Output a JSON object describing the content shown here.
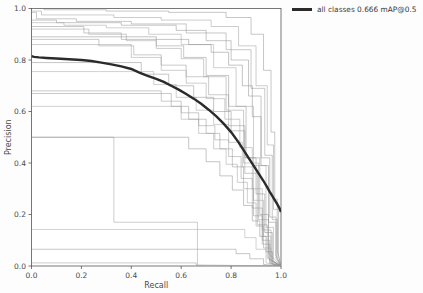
{
  "legend": {
    "entries": [
      {
        "label": "all classes 0.666 mAP@0.5",
        "color": "#2b2b2b",
        "style": "solid-thick"
      }
    ],
    "position": "top-right-outside"
  },
  "axes": {
    "xlabel": "Recall",
    "ylabel": "Precision",
    "xticks": [
      "0.0",
      "0.2",
      "0.4",
      "0.6",
      "0.8",
      "1.0"
    ],
    "yticks": [
      "0.0",
      "0.2",
      "0.4",
      "0.6",
      "0.8",
      "1.0"
    ],
    "xlim": [
      0,
      1
    ],
    "ylim": [
      0,
      1
    ]
  },
  "chart_data": {
    "type": "line",
    "title": "",
    "xlabel": "Recall",
    "ylabel": "Precision",
    "xlim": [
      0,
      1
    ],
    "ylim": [
      0,
      1
    ],
    "grid": false,
    "legend_position": "upper right outside",
    "tick_labels": {
      "x": [
        "0.0",
        "0.2",
        "0.4",
        "0.6",
        "0.8",
        "1.0"
      ],
      "y": [
        "0.0",
        "0.2",
        "0.4",
        "0.6",
        "0.8",
        "1.0"
      ]
    },
    "annotations": [
      "all classes 0.666 mAP@0.5"
    ],
    "series": [
      {
        "name": "all classes 0.666 mAP@0.5",
        "kind": "mean",
        "color": "#2b2b2b",
        "linewidth": 2.4,
        "x": [
          0.0,
          0.01,
          0.03,
          0.06,
          0.1,
          0.15,
          0.2,
          0.24,
          0.28,
          0.32,
          0.36,
          0.4,
          0.43,
          0.46,
          0.5,
          0.53,
          0.56,
          0.59,
          0.62,
          0.65,
          0.68,
          0.71,
          0.74,
          0.77,
          0.8,
          0.83,
          0.85,
          0.87,
          0.89,
          0.91,
          0.93,
          0.945,
          0.955,
          0.965,
          0.975,
          0.985,
          0.995,
          1.0
        ],
        "y": [
          0.815,
          0.812,
          0.81,
          0.808,
          0.806,
          0.803,
          0.8,
          0.796,
          0.79,
          0.783,
          0.775,
          0.765,
          0.752,
          0.74,
          0.727,
          0.715,
          0.7,
          0.685,
          0.668,
          0.65,
          0.63,
          0.607,
          0.582,
          0.553,
          0.52,
          0.48,
          0.45,
          0.42,
          0.39,
          0.36,
          0.33,
          0.305,
          0.288,
          0.272,
          0.256,
          0.24,
          0.222,
          0.21
        ]
      },
      {
        "name": "class-a",
        "kind": "per-class",
        "color": "#8d8d8d",
        "x": [
          0.0,
          0.05,
          0.05,
          0.3,
          0.3,
          0.55,
          0.55,
          0.78,
          0.78,
          0.88,
          0.88,
          0.93,
          0.93,
          0.96,
          0.96,
          0.975,
          0.975,
          0.985,
          0.985,
          1.0
        ],
        "y": [
          1.0,
          1.0,
          0.995,
          0.995,
          0.99,
          0.99,
          0.985,
          0.985,
          0.965,
          0.965,
          0.9,
          0.9,
          0.76,
          0.76,
          0.52,
          0.52,
          0.26,
          0.26,
          0.06,
          0.0
        ]
      },
      {
        "name": "class-b",
        "kind": "per-class",
        "color": "#999999",
        "x": [
          0.0,
          0.04,
          0.04,
          0.33,
          0.33,
          0.52,
          0.52,
          0.72,
          0.72,
          0.83,
          0.83,
          0.9,
          0.9,
          0.945,
          0.945,
          0.97,
          0.97,
          0.99,
          0.99,
          1.0
        ],
        "y": [
          0.99,
          0.99,
          0.975,
          0.975,
          0.965,
          0.965,
          0.955,
          0.955,
          0.93,
          0.93,
          0.855,
          0.855,
          0.7,
          0.7,
          0.47,
          0.47,
          0.22,
          0.22,
          0.04,
          0.0
        ]
      },
      {
        "name": "class-c",
        "kind": "per-class",
        "color": "#909090",
        "x": [
          0.0,
          0.02,
          0.02,
          0.18,
          0.18,
          0.4,
          0.4,
          0.62,
          0.62,
          0.78,
          0.78,
          0.88,
          0.88,
          0.935,
          0.935,
          0.965,
          0.965,
          0.985,
          0.985,
          1.0
        ],
        "y": [
          0.985,
          0.985,
          0.96,
          0.96,
          0.95,
          0.95,
          0.94,
          0.94,
          0.905,
          0.905,
          0.84,
          0.84,
          0.69,
          0.69,
          0.43,
          0.43,
          0.18,
          0.18,
          0.03,
          0.0
        ]
      },
      {
        "name": "class-d",
        "kind": "per-class",
        "color": "#8a8a8a",
        "x": [
          0.0,
          0.1,
          0.1,
          0.36,
          0.36,
          0.58,
          0.58,
          0.7,
          0.7,
          0.8,
          0.8,
          0.87,
          0.87,
          0.92,
          0.92,
          0.955,
          0.955,
          0.98,
          0.98,
          1.0
        ],
        "y": [
          0.955,
          0.955,
          0.945,
          0.945,
          0.935,
          0.935,
          0.915,
          0.915,
          0.875,
          0.875,
          0.8,
          0.8,
          0.66,
          0.66,
          0.42,
          0.42,
          0.19,
          0.19,
          0.04,
          0.0
        ]
      },
      {
        "name": "class-e",
        "kind": "per-class",
        "color": "#a0a0a0",
        "x": [
          0.0,
          0.13,
          0.13,
          0.3,
          0.3,
          0.47,
          0.47,
          0.6,
          0.6,
          0.73,
          0.73,
          0.82,
          0.82,
          0.89,
          0.89,
          0.94,
          0.94,
          0.97,
          0.97,
          1.0
        ],
        "y": [
          0.945,
          0.945,
          0.935,
          0.935,
          0.925,
          0.925,
          0.9,
          0.9,
          0.86,
          0.86,
          0.77,
          0.77,
          0.62,
          0.62,
          0.39,
          0.39,
          0.15,
          0.15,
          0.02,
          0.0
        ]
      },
      {
        "name": "class-f",
        "kind": "per-class",
        "color": "#8f8f8f",
        "x": [
          0.0,
          0.21,
          0.21,
          0.36,
          0.36,
          0.5,
          0.5,
          0.61,
          0.61,
          0.7,
          0.7,
          0.79,
          0.79,
          0.86,
          0.86,
          0.915,
          0.915,
          0.95,
          0.95,
          1.0
        ],
        "y": [
          0.93,
          0.93,
          0.905,
          0.905,
          0.88,
          0.88,
          0.855,
          0.855,
          0.81,
          0.81,
          0.74,
          0.74,
          0.62,
          0.62,
          0.42,
          0.42,
          0.2,
          0.2,
          0.05,
          0.0
        ]
      },
      {
        "name": "class-g",
        "kind": "per-class",
        "color": "#979797",
        "x": [
          0.0,
          0.23,
          0.23,
          0.38,
          0.38,
          0.5,
          0.5,
          0.6,
          0.6,
          0.69,
          0.69,
          0.78,
          0.78,
          0.85,
          0.85,
          0.91,
          0.91,
          0.95,
          0.95,
          1.0
        ],
        "y": [
          0.92,
          0.92,
          0.9,
          0.9,
          0.875,
          0.875,
          0.845,
          0.845,
          0.805,
          0.805,
          0.735,
          0.735,
          0.605,
          0.605,
          0.4,
          0.4,
          0.18,
          0.18,
          0.03,
          0.0
        ]
      },
      {
        "name": "class-h",
        "kind": "per-class",
        "color": "#868686",
        "x": [
          0.0,
          0.5,
          0.5,
          0.63,
          0.63,
          0.72,
          0.72,
          0.79,
          0.79,
          0.845,
          0.845,
          0.885,
          0.885,
          0.92,
          0.92,
          0.95,
          0.95,
          0.98,
          0.98,
          1.0
        ],
        "y": [
          0.89,
          0.89,
          0.88,
          0.88,
          0.86,
          0.86,
          0.83,
          0.83,
          0.78,
          0.78,
          0.7,
          0.7,
          0.58,
          0.58,
          0.39,
          0.39,
          0.17,
          0.17,
          0.03,
          0.0
        ]
      },
      {
        "name": "class-i",
        "kind": "per-class",
        "color": "#929292",
        "x": [
          0.0,
          0.27,
          0.27,
          0.41,
          0.41,
          0.52,
          0.52,
          0.62,
          0.62,
          0.71,
          0.71,
          0.79,
          0.79,
          0.855,
          0.855,
          0.905,
          0.905,
          0.945,
          0.945,
          1.0
        ],
        "y": [
          0.88,
          0.88,
          0.855,
          0.855,
          0.82,
          0.82,
          0.78,
          0.78,
          0.735,
          0.735,
          0.665,
          0.665,
          0.545,
          0.545,
          0.36,
          0.36,
          0.16,
          0.16,
          0.03,
          0.0
        ]
      },
      {
        "name": "class-j",
        "kind": "per-class",
        "color": "#9c9c9c",
        "x": [
          0.0,
          0.4,
          0.4,
          0.52,
          0.52,
          0.62,
          0.62,
          0.7,
          0.7,
          0.775,
          0.775,
          0.835,
          0.835,
          0.885,
          0.885,
          0.925,
          0.925,
          0.96,
          0.96,
          1.0
        ],
        "y": [
          0.86,
          0.86,
          0.81,
          0.81,
          0.76,
          0.76,
          0.71,
          0.71,
          0.65,
          0.65,
          0.57,
          0.57,
          0.46,
          0.46,
          0.3,
          0.3,
          0.14,
          0.14,
          0.02,
          0.0
        ]
      },
      {
        "name": "class-k",
        "kind": "per-class",
        "color": "#8b8b8b",
        "x": [
          0.0,
          0.44,
          0.44,
          0.55,
          0.55,
          0.65,
          0.65,
          0.73,
          0.73,
          0.8,
          0.8,
          0.855,
          0.855,
          0.9,
          0.9,
          0.935,
          0.935,
          0.965,
          0.965,
          1.0
        ],
        "y": [
          0.79,
          0.79,
          0.745,
          0.745,
          0.7,
          0.7,
          0.655,
          0.655,
          0.6,
          0.6,
          0.525,
          0.525,
          0.42,
          0.42,
          0.28,
          0.28,
          0.13,
          0.13,
          0.02,
          0.0
        ]
      },
      {
        "name": "class-l",
        "kind": "per-class",
        "color": "#a2a2a2",
        "x": [
          0.0,
          0.49,
          0.49,
          0.58,
          0.58,
          0.66,
          0.66,
          0.73,
          0.73,
          0.79,
          0.79,
          0.845,
          0.845,
          0.89,
          0.89,
          0.93,
          0.93,
          0.96,
          0.96,
          1.0
        ],
        "y": [
          0.755,
          0.755,
          0.705,
          0.705,
          0.655,
          0.655,
          0.605,
          0.605,
          0.55,
          0.55,
          0.48,
          0.48,
          0.385,
          0.385,
          0.255,
          0.255,
          0.115,
          0.115,
          0.02,
          0.0
        ]
      },
      {
        "name": "class-m",
        "kind": "per-class",
        "color": "#949494",
        "x": [
          0.0,
          0.52,
          0.52,
          0.6,
          0.6,
          0.67,
          0.67,
          0.735,
          0.735,
          0.79,
          0.79,
          0.84,
          0.84,
          0.885,
          0.885,
          0.925,
          0.925,
          0.955,
          0.955,
          1.0
        ],
        "y": [
          0.68,
          0.68,
          0.64,
          0.64,
          0.595,
          0.595,
          0.545,
          0.545,
          0.49,
          0.49,
          0.425,
          0.425,
          0.34,
          0.34,
          0.225,
          0.225,
          0.1,
          0.1,
          0.015,
          0.0
        ]
      },
      {
        "name": "class-n",
        "kind": "per-class",
        "color": "#8e8e8e",
        "x": [
          0.0,
          0.56,
          0.56,
          0.63,
          0.63,
          0.7,
          0.7,
          0.755,
          0.755,
          0.805,
          0.805,
          0.85,
          0.85,
          0.89,
          0.89,
          0.925,
          0.925,
          0.955,
          0.955,
          1.0
        ],
        "y": [
          0.67,
          0.67,
          0.62,
          0.62,
          0.57,
          0.57,
          0.515,
          0.515,
          0.455,
          0.455,
          0.385,
          0.385,
          0.3,
          0.3,
          0.195,
          0.195,
          0.085,
          0.085,
          0.01,
          0.0
        ]
      },
      {
        "name": "class-o",
        "kind": "per-class",
        "color": "#9e9e9e",
        "x": [
          0.0,
          0.6,
          0.6,
          0.67,
          0.67,
          0.73,
          0.73,
          0.78,
          0.78,
          0.825,
          0.825,
          0.865,
          0.865,
          0.9,
          0.9,
          0.93,
          0.93,
          0.96,
          0.96,
          1.0
        ],
        "y": [
          0.62,
          0.62,
          0.57,
          0.57,
          0.515,
          0.515,
          0.455,
          0.455,
          0.395,
          0.395,
          0.325,
          0.325,
          0.245,
          0.245,
          0.155,
          0.155,
          0.07,
          0.07,
          0.01,
          0.0
        ]
      },
      {
        "name": "class-p",
        "kind": "per-class",
        "color": "#898989",
        "x": [
          0.0,
          0.63,
          0.63,
          0.7,
          0.7,
          0.755,
          0.755,
          0.805,
          0.805,
          0.85,
          0.85,
          0.885,
          0.885,
          0.915,
          0.915,
          0.94,
          0.94,
          0.965,
          0.965,
          1.0
        ],
        "y": [
          0.5,
          0.5,
          0.455,
          0.455,
          0.405,
          0.405,
          0.35,
          0.35,
          0.295,
          0.295,
          0.235,
          0.235,
          0.175,
          0.175,
          0.115,
          0.115,
          0.055,
          0.055,
          0.008,
          0.0
        ]
      },
      {
        "name": "class-q-box",
        "kind": "per-class",
        "color": "#9a9a9a",
        "x": [
          0.0,
          0.33,
          0.33,
          0.665,
          0.665,
          1.0
        ],
        "y": [
          0.5,
          0.5,
          0.17,
          0.17,
          0.0,
          0.0
        ]
      },
      {
        "name": "class-r-flat-high",
        "kind": "per-class",
        "color": "#a4a4a4",
        "x": [
          0.0,
          0.855,
          0.855,
          0.9,
          0.9,
          0.94,
          0.94,
          1.0
        ],
        "y": [
          0.142,
          0.142,
          0.11,
          0.11,
          0.065,
          0.065,
          0.012,
          0.0
        ]
      },
      {
        "name": "class-s-flat-low",
        "kind": "per-class",
        "color": "#8c8c8c",
        "x": [
          0.0,
          0.82,
          0.82,
          0.875,
          0.875,
          0.93,
          0.93,
          1.0
        ],
        "y": [
          0.065,
          0.065,
          0.048,
          0.048,
          0.028,
          0.028,
          0.006,
          0.0
        ]
      },
      {
        "name": "class-t-spike",
        "kind": "per-class",
        "color": "#969696",
        "x": [
          0.0,
          0.66,
          0.66,
          1.0
        ],
        "y": [
          0.012,
          0.012,
          0.004,
          0.0
        ]
      }
    ]
  }
}
